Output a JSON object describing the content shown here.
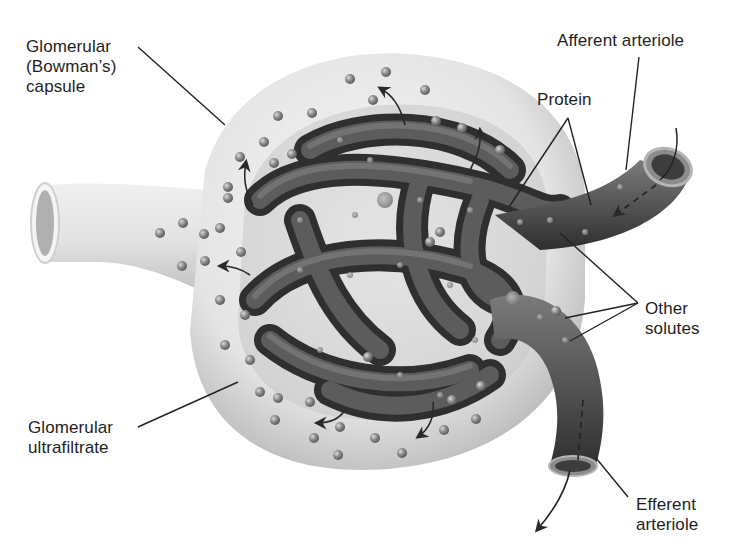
{
  "diagram": {
    "colors": {
      "background": "#ffffff",
      "capsule_light": "#f2f2f2",
      "capsule_shade": "#bdbdbd",
      "vessel_dark": "#3a3a3a",
      "vessel_mid": "#6a6a6a",
      "particle": "#8c8c8c",
      "text": "#1e1e1e",
      "leader_line": "#222222"
    },
    "labels": [
      {
        "id": "bowmans-capsule",
        "text": "Glomerular\n(Bowman’s)\ncapsule"
      },
      {
        "id": "afferent-arteriole",
        "text": "Afferent arteriole"
      },
      {
        "id": "protein",
        "text": "Protein"
      },
      {
        "id": "other-solutes",
        "text": "Other\nsolutes"
      },
      {
        "id": "glomerular-ultrafiltrate",
        "text": "Glomerular\nultrafiltrate"
      },
      {
        "id": "efferent-arteriole",
        "text": "Efferent\narteriole"
      }
    ],
    "arrows": {
      "filtration_arrows": 6,
      "blood_flow_in": "into afferent arteriole (dashed)",
      "blood_flow_out": "out of efferent arteriole (dashed)"
    }
  }
}
